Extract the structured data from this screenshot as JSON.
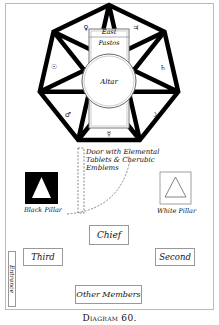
{
  "diagram": {
    "caption": "Diagram 60.",
    "temple": {
      "east_label": "East",
      "pastos_label": "Pastos",
      "altar_label": "Altar",
      "planet_glyphs": {
        "top_left": "♀",
        "top_right": "♃",
        "left": "☉",
        "right": "♄",
        "lower_left": "♂",
        "lower_right": "☽",
        "bottom": "☿"
      }
    },
    "door_label_lines": [
      "Door with Elemental",
      "Tablets & Cherubic",
      "Emblems"
    ],
    "black_pillar_label": "Black Pillar",
    "white_pillar_label": "White Pillar",
    "stations": {
      "chief": "Chief",
      "third": "Third",
      "second": "Second",
      "other_members": "Other Members"
    },
    "entrance_label": "Entrance"
  }
}
